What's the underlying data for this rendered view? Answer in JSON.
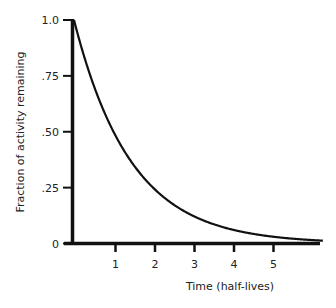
{
  "chart_data": {
    "type": "line",
    "title": "",
    "xlabel": "Time (half-lives)",
    "ylabel": "Fraction of activity remaining",
    "x_ticks": [
      "1",
      "2",
      "3",
      "4",
      "5"
    ],
    "y_ticks": [
      "0",
      ".25",
      ".50",
      ".75",
      "1.0"
    ],
    "xlim": [
      0,
      6.3
    ],
    "ylim": [
      0,
      1.0
    ],
    "grid": false,
    "legend": null,
    "series": [
      {
        "name": "Radioactive decay",
        "function": "0.5^t",
        "x": [
          0,
          0.5,
          1,
          1.5,
          2,
          2.5,
          3,
          3.5,
          4,
          4.5,
          5,
          5.5,
          6,
          6.3
        ],
        "y": [
          1.0,
          0.707,
          0.5,
          0.354,
          0.25,
          0.177,
          0.125,
          0.088,
          0.0625,
          0.044,
          0.031,
          0.022,
          0.016,
          0.013
        ]
      }
    ]
  },
  "colors": {
    "line": "#111111",
    "axis": "#111111",
    "text": "#222222"
  }
}
